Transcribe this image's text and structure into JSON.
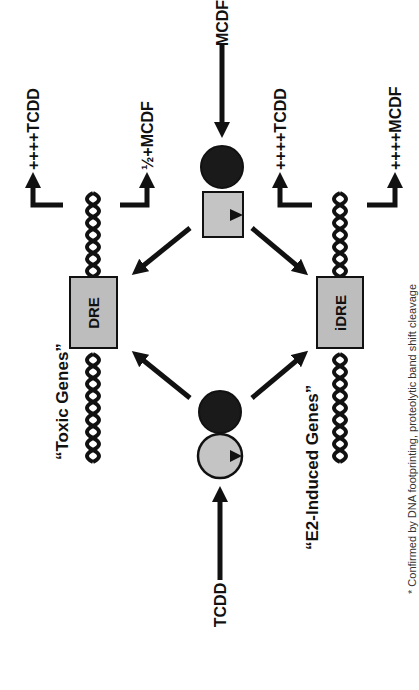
{
  "diagram": {
    "orientation": "rotated-90-ccw",
    "colors": {
      "ink": "#111111",
      "box_fill": "#bdbdbd",
      "receptor_fill": "#1a1a1a",
      "ligand_fill": "#c4c4c4",
      "background": "#ffffff"
    },
    "ligands": {
      "mcdf": "MCDF",
      "tcdd": "TCDD"
    },
    "elements": {
      "dre": "DRE",
      "idre": "iDRE"
    },
    "gene_groups": {
      "toxic": "“Toxic Genes”",
      "e2": "“E2-Induced Genes”"
    },
    "outputs": {
      "dre_tcdd": "++++TCDD",
      "dre_mcdf": "½+MCDF",
      "idre_tcdd": "++++TCDD",
      "idre_mcdf": "++++MCDF"
    },
    "footnote": "* Confirmed by DNA footprinting, proteolytic band shift cleavage"
  }
}
